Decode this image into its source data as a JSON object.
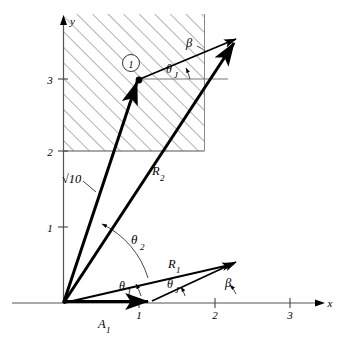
{
  "figure": {
    "kind": "vector-phasor-diagram",
    "background": "#ffffff",
    "ink": "#000000",
    "hatch_color": "#555555"
  },
  "axes": {
    "x_label": "x",
    "y_label": "y",
    "x_ticks": [
      "1",
      "2",
      "3"
    ],
    "y_ticks": [
      "1",
      "2",
      "3"
    ],
    "origin": [
      0,
      0
    ],
    "x_range": [
      0,
      3.4
    ],
    "y_range": [
      0,
      3.6
    ]
  },
  "region": {
    "name": "hatched-region",
    "x_from": 0,
    "x_to": 2.9,
    "y_from": 2.0,
    "y_to": 3.65,
    "hatch_angle_deg": 45
  },
  "markers": [
    {
      "name": "point-one-circle",
      "label": "1",
      "at": [
        1.0,
        3.0
      ]
    }
  ],
  "vectors": [
    {
      "name": "sqrt10-vector",
      "label": "√10",
      "from": [
        0,
        0
      ],
      "to": [
        1.0,
        3.0
      ]
    },
    {
      "name": "R2-vector",
      "label": "R",
      "sub": "2",
      "from": [
        0,
        0
      ],
      "to": [
        2.95,
        3.5
      ]
    },
    {
      "name": "R1-vector",
      "label": "R",
      "sub": "1",
      "from": [
        0,
        0
      ],
      "to": [
        2.95,
        0.67
      ]
    },
    {
      "name": "A1-vector",
      "label": "A",
      "sub": "1",
      "from": [
        0,
        0
      ],
      "to": [
        1.5,
        0.0
      ]
    },
    {
      "name": "upper-link-vector",
      "from": [
        1.0,
        3.0
      ],
      "to": [
        2.95,
        3.5
      ]
    },
    {
      "name": "lower-link-vector",
      "from": [
        1.5,
        0.0
      ],
      "to": [
        2.95,
        0.67
      ]
    }
  ],
  "reference_lines": [
    {
      "name": "horizontal-ref-at-point-one",
      "from": [
        1.0,
        3.0
      ],
      "to": [
        3.15,
        3.0
      ]
    }
  ],
  "angles": [
    {
      "name": "theta-1-angle",
      "label": "θ",
      "sub": "1",
      "vertex": [
        0,
        0
      ],
      "at_label": [
        1.18,
        0.24
      ]
    },
    {
      "name": "theta-2-angle",
      "label": "θ",
      "sub": "2",
      "vertex": [
        0,
        0
      ],
      "at_label": [
        1.48,
        0.97
      ]
    },
    {
      "name": "theta-J-angle-lower",
      "label": "θ",
      "sub": "J",
      "vertex": [
        1.5,
        0.0
      ],
      "at_label": [
        1.78,
        0.3
      ]
    },
    {
      "name": "beta-angle-lower",
      "label": "β",
      "vertex": [
        2.08,
        0.0
      ],
      "at_label": [
        2.33,
        0.33
      ]
    },
    {
      "name": "theta-J-angle-upper",
      "label": "θ",
      "sub": "J",
      "vertex": [
        1.0,
        3.0
      ],
      "at_label": [
        1.72,
        3.21
      ]
    },
    {
      "name": "beta-angle-upper",
      "label": "β",
      "vertex": [
        2.3,
        3.2
      ],
      "at_label": [
        1.95,
        3.46
      ]
    }
  ],
  "leaders": [
    {
      "name": "sqrt10-leader",
      "from": [
        0.7,
        1.77
      ],
      "to": [
        0.9,
        1.62
      ]
    }
  ]
}
